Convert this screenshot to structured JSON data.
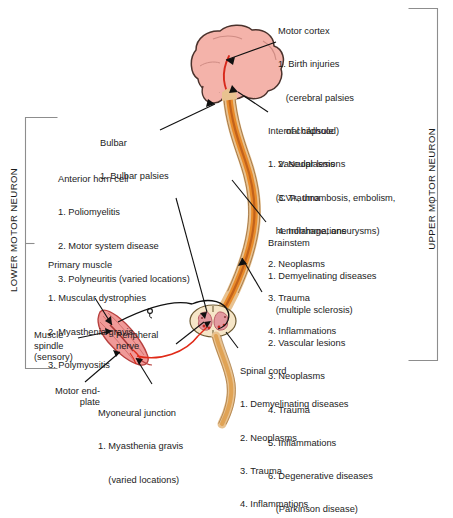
{
  "figure": {
    "brackets": {
      "lower": "LOWER MOTOR NEURON",
      "upper": "UPPER MOTOR NEURON"
    },
    "colors": {
      "brain_fill": "#f4b3aa",
      "brain_edge": "#3a2a26",
      "cord_fill": "#e8c290",
      "cord_stripe": "#e07b23",
      "cord_stripe_dark": "#b8521a",
      "muscle_fill": "#f09a98",
      "muscle_edge": "#c04a46",
      "section_fill": "#f6e6c8",
      "gray_matter": "#e8a0a6",
      "nerve_red": "#e02a18",
      "nerve_black": "#101010",
      "leader": "#101010"
    }
  },
  "labels": {
    "motor_cortex": {
      "heading": "Motor cortex",
      "items": [
        "1. Birth injuries",
        "   (cerebral palsies",
        "   of childhood)",
        "2. Neoplasms",
        "3. Trauma",
        "4. Inflammations"
      ]
    },
    "internal_capsule": {
      "heading": "Internal capsule",
      "items": [
        "1. Vascular lesions",
        "   (CVA, thrombosis, embolism,",
        "   hemorrhage, aneurysms)",
        "2. Neoplasms",
        "3. Trauma",
        "4. Inflammations"
      ]
    },
    "brainstem": {
      "heading": "Brainstem",
      "items": [
        "1. Demyelinating diseases",
        "   (multiple sclerosis)",
        "2. Vascular lesions",
        "3. Neoplasms",
        "4. Trauma",
        "5. Inflammations",
        "6. Degenerative diseases",
        "   (Parkinson disease)"
      ]
    },
    "spinal_cord": {
      "heading": "Spinal cord",
      "items": [
        "1. Demyelinating diseases",
        "2. Neoplasms",
        "3. Trauma",
        "4. Inflammations"
      ]
    },
    "bulbar": {
      "heading": "Bulbar",
      "items": [
        "1. Bulbar palsies"
      ]
    },
    "anterior_horn_cell": {
      "heading": "Anterior horn cell",
      "items": [
        "1. Poliomyelitis",
        "2. Motor system disease",
        "3. Polyneuritis (varied locations)"
      ]
    },
    "primary_muscle": {
      "heading": "Primary muscle",
      "items": [
        "1. Muscular dystrophies",
        "2. Myasthenia gravis",
        "3. Polymyositis"
      ]
    },
    "myoneural_junction": {
      "heading": "Myoneural junction",
      "items": [
        "1. Myasthenia gravis",
        "    (varied locations)"
      ]
    },
    "muscle_spindle": "Muscle\nspindle\n(sensory)",
    "motor_end_plate": "Motor end-\nplate",
    "peripheral_nerve": "Peripheral\nnerve"
  }
}
